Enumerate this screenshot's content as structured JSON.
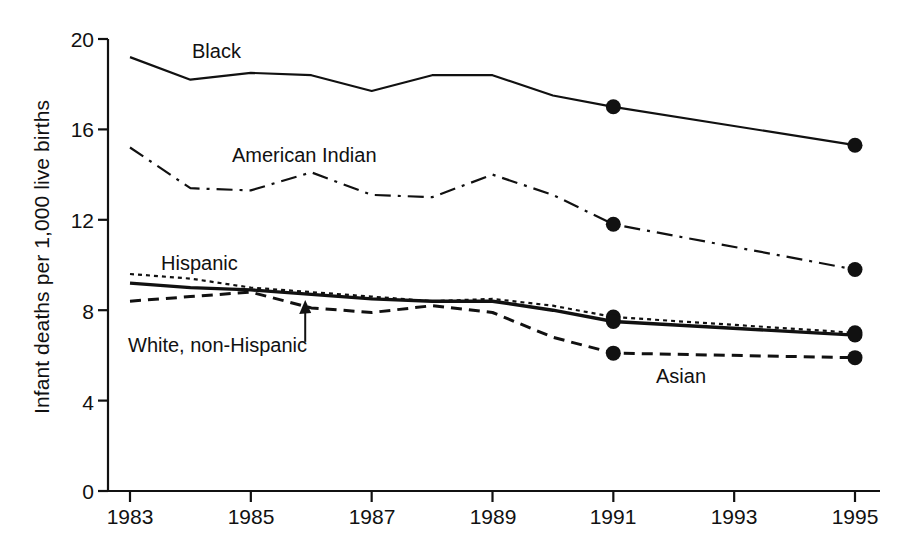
{
  "chart_data": {
    "type": "line",
    "title": "",
    "xlabel": "",
    "ylabel": "Infant deaths per 1,000 live births",
    "xlim": [
      1983,
      1995
    ],
    "ylim": [
      0,
      20
    ],
    "yticks": [
      "0",
      "4",
      "8",
      "12",
      "16",
      "20"
    ],
    "ytick_values": [
      0,
      4,
      8,
      12,
      16,
      20
    ],
    "xticks": [
      "1983",
      "1985",
      "1987",
      "1989",
      "1991",
      "1993",
      "1995"
    ],
    "xtick_values": [
      1983,
      1985,
      1987,
      1989,
      1991,
      1993,
      1995
    ],
    "grid": false,
    "legend": "inline-labels",
    "x": [
      1983,
      1984,
      1985,
      1986,
      1987,
      1988,
      1989,
      1990,
      1991,
      1995
    ],
    "series": [
      {
        "name": "Black",
        "label": "Black",
        "style": "solid",
        "color": "#111111",
        "width": 2.2,
        "markers_at": [
          1991,
          1995
        ],
        "values": [
          19.2,
          18.2,
          18.5,
          18.4,
          17.7,
          18.4,
          18.4,
          17.5,
          17.0,
          15.3
        ]
      },
      {
        "name": "American Indian",
        "label": "American Indian",
        "style": "dash-dot",
        "color": "#111111",
        "width": 2.2,
        "markers_at": [
          1991,
          1995
        ],
        "values": [
          15.2,
          13.4,
          13.3,
          14.1,
          13.1,
          13.0,
          14.0,
          13.1,
          11.8,
          9.8
        ]
      },
      {
        "name": "Hispanic",
        "label": "Hispanic",
        "style": "dotted",
        "color": "#111111",
        "width": 2.2,
        "markers_at": [
          1991,
          1995
        ],
        "values": [
          9.6,
          9.4,
          9.0,
          8.8,
          8.6,
          8.4,
          8.5,
          8.2,
          7.7,
          7.0
        ]
      },
      {
        "name": "White, non-Hispanic",
        "label": "White, non-Hispanic",
        "style": "solid",
        "color": "#111111",
        "width": 3.4,
        "markers_at": [
          1991,
          1995
        ],
        "values": [
          9.2,
          9.0,
          8.9,
          8.7,
          8.5,
          8.4,
          8.4,
          8.0,
          7.5,
          6.9
        ]
      },
      {
        "name": "Asian",
        "label": "Asian",
        "style": "dashed",
        "color": "#111111",
        "width": 3.0,
        "markers_at": [
          1991,
          1995
        ],
        "values": [
          8.4,
          8.6,
          8.8,
          8.1,
          7.9,
          8.2,
          7.9,
          6.8,
          6.1,
          5.9
        ]
      }
    ],
    "annotations": [
      {
        "name": "white-non-hispanic-pointer",
        "text": "",
        "from_x": 1985.9,
        "from_y": 6.6,
        "to_x": 1985.9,
        "to_y": 8.45
      }
    ]
  },
  "labels": {
    "y_axis_title": "Infant deaths per 1,000 live births",
    "y_0": "0",
    "y_4": "4",
    "y_8": "8",
    "y_12": "12",
    "y_16": "16",
    "y_20": "20",
    "x_1983": "1983",
    "x_1985": "1985",
    "x_1987": "1987",
    "x_1989": "1989",
    "x_1991": "1991",
    "x_1993": "1993",
    "x_1995": "1995",
    "series_black": "Black",
    "series_american_indian": "American Indian",
    "series_hispanic": "Hispanic",
    "series_white": "White, non-Hispanic",
    "series_asian": "Asian"
  }
}
